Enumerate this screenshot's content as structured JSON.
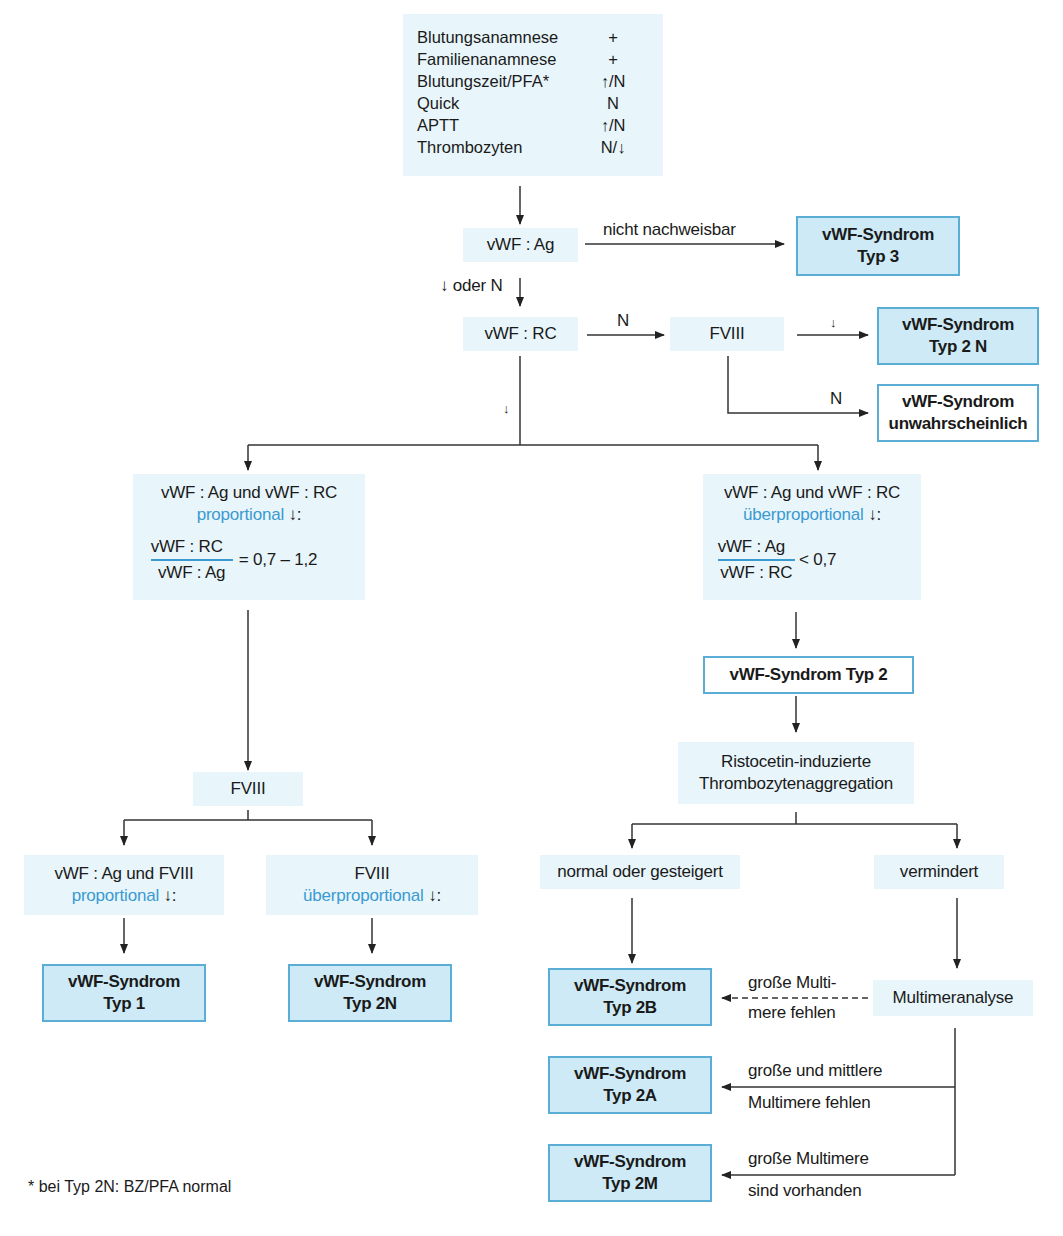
{
  "history_box": {
    "rows": [
      {
        "label": "Blutungsanamnese",
        "value": "+"
      },
      {
        "label": "Familienanamnese",
        "value": "+"
      },
      {
        "label": "Blutungszeit/PFA*",
        "value": "↑/N"
      },
      {
        "label": "Quick",
        "value": "N"
      },
      {
        "label": "APTT",
        "value": "↑/N"
      },
      {
        "label": "Thrombozyten",
        "value": "N/↓"
      }
    ]
  },
  "nodes": {
    "vwf_ag": "vWF : Ag",
    "vwf_rc": "vWF : RC",
    "fviii_top": "FVIII",
    "left_branch": {
      "line1": "vWF : Ag und vWF : RC",
      "line2_blue": "proportional",
      "line2_suffix": " ↓:",
      "frac_num": "vWF : RC",
      "frac_den": "vWF : Ag",
      "frac_value": "= 0,7 – 1,2"
    },
    "right_branch": {
      "line1": "vWF : Ag und vWF : RC",
      "line2_blue": "überproportional",
      "line2_suffix": " ↓:",
      "frac_num": "vWF : Ag",
      "frac_den": "vWF : RC",
      "frac_value": "< 0,7"
    },
    "typ2_box": "vWF-Syndrom Typ 2",
    "ristocetin": {
      "line1": "Ristocetin-induzierte",
      "line2": "Thrombozytenaggregation"
    },
    "fviii_left": "FVIII",
    "fviii_prop": {
      "line1": "vWF : Ag und FVIII",
      "line2_blue": "proportional",
      "line2_suffix": " ↓:"
    },
    "fviii_over": {
      "line1": "FVIII",
      "line2_blue": "überproportional",
      "line2_suffix": " ↓:"
    },
    "normal_oder_gesteigert": "normal oder gesteigert",
    "vermindert": "vermindert",
    "multimeranalyse": "Multimeranalyse"
  },
  "results": {
    "typ3": {
      "line1": "vWF-Syndrom",
      "line2": "Typ 3"
    },
    "typ2n_top": {
      "line1": "vWF-Syndrom",
      "line2": "Typ 2 N"
    },
    "unwahrscheinlich": {
      "line1": "vWF-Syndrom",
      "line2": "unwahrscheinlich"
    },
    "typ1": {
      "line1": "vWF-Syndrom",
      "line2": "Typ 1"
    },
    "typ2n": {
      "line1": "vWF-Syndrom",
      "line2": "Typ 2N"
    },
    "typ2b": {
      "line1": "vWF-Syndrom",
      "line2": "Typ 2B"
    },
    "typ2a": {
      "line1": "vWF-Syndrom",
      "line2": "Typ 2A"
    },
    "typ2m": {
      "line1": "vWF-Syndrom",
      "line2": "Typ 2M"
    }
  },
  "edge_labels": {
    "nicht_nachweisbar": "nicht nachweisbar",
    "down_oder_n": "↓ oder N",
    "n_rc_fviii": "N",
    "down_fviii": "↓",
    "n_fviii": "N",
    "down_rc": "↓",
    "grosse_multi_1": "große Multi-",
    "grosse_multi_2": "mere fehlen",
    "grosse_mittlere_1": "große und mittlere",
    "grosse_mittlere_2": "Multimere fehlen",
    "grosse_vorhanden_1": "große Multimere",
    "grosse_vorhanden_2": "sind vorhanden"
  },
  "footnote": "* bei Typ 2N: BZ/PFA normal",
  "colors": {
    "node_fill": "#e8f5fa",
    "result_fill": "#cdeaf6",
    "result_border": "#5aaed6",
    "accent_text": "#3a9ad1"
  }
}
